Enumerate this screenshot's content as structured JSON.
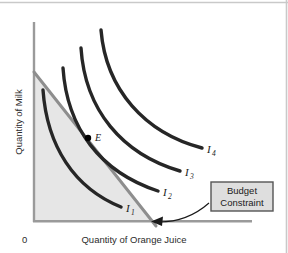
{
  "figure": {
    "type": "indifference-curve-diagram",
    "background": "#ffffff",
    "frame_color": "#c9c9c9",
    "axes": {
      "color": "#9a9a9a",
      "x_label": "Quantity of Orange Juice",
      "y_label": "Quantity of Milk",
      "origin_label": "0"
    },
    "budget_constraint": {
      "label_line1": "Budget",
      "label_line2": "Constraint",
      "line_color": "#8e8e8e",
      "feasible_region_fill": "#e6e6e6",
      "box_fill": "#dedede",
      "box_border": "#555555"
    },
    "optimum_point": {
      "label": "E",
      "color": "#000000"
    },
    "curves": [
      {
        "label": "I",
        "subscript": "1",
        "color": "#262626"
      },
      {
        "label": "I",
        "subscript": "2",
        "color": "#262626"
      },
      {
        "label": "I",
        "subscript": "3",
        "color": "#262626"
      },
      {
        "label": "I",
        "subscript": "4",
        "color": "#262626"
      }
    ]
  }
}
